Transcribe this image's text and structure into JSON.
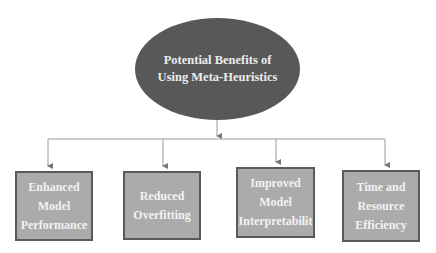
{
  "diagram": {
    "type": "hierarchy",
    "root": {
      "lines": [
        "Potential Benefits of",
        "Using Meta-Heuristics"
      ],
      "fill": "#585858"
    },
    "children": [
      {
        "lines": [
          "Enhanced",
          "Model",
          "Performance"
        ]
      },
      {
        "lines": [
          "Reduced",
          "Overfitting"
        ]
      },
      {
        "lines": [
          "Improved",
          "Model",
          "Interpretabilit"
        ]
      },
      {
        "lines": [
          "Time and",
          "Resource",
          "Efficiency"
        ]
      }
    ],
    "colors": {
      "box_fill": "#ababab",
      "box_border": "#5a5a5a",
      "connector": "#9a9a9a"
    }
  }
}
